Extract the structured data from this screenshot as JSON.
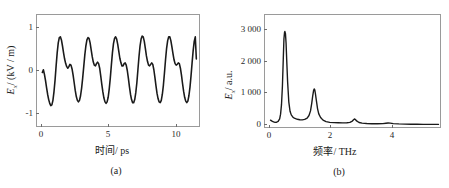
{
  "figure": {
    "background": "#ffffff",
    "line_color": "#1a1a1a",
    "frame_color": "#9a9a9a"
  },
  "panel_a": {
    "caption": "(a)",
    "xlabel_cjk": "时间",
    "xlabel_unit": "/ ps",
    "ylabel_sym": "E",
    "ylabel_sub": "x",
    "ylabel_unit": "/ (kV / m)",
    "xticks": [
      "0",
      "5",
      "10"
    ],
    "yticks": [
      "1",
      "0",
      "-1"
    ]
  },
  "panel_b": {
    "caption": "(b)",
    "xlabel_cjk": "频率",
    "xlabel_unit": "/ THz",
    "ylabel_sym": "E",
    "ylabel_sub": "x",
    "ylabel_unit": "/ a.u.",
    "xticks": [
      "0",
      "2",
      "4"
    ],
    "yticks": [
      "3 000",
      "2 000",
      "1 000",
      "0"
    ]
  },
  "chart_data": [
    {
      "type": "line",
      "id": "panel-a-waveform",
      "title": "(a)",
      "xlabel": "时间/ps",
      "ylabel": "Ex/(kV/m)",
      "xlim": [
        -0.4,
        11.8
      ],
      "ylim": [
        -1.45,
        1.45
      ],
      "xticks": [
        0,
        5,
        10
      ],
      "yticks": [
        -1,
        0,
        1
      ],
      "grid": false,
      "legend": null,
      "x": [
        0.0,
        0.08,
        0.16,
        0.24,
        0.32,
        0.4,
        0.48,
        0.56,
        0.64,
        0.72,
        0.8,
        0.88,
        0.96,
        1.04,
        1.12,
        1.2,
        1.28,
        1.36,
        1.44,
        1.52,
        1.6,
        1.68,
        1.76,
        1.84,
        1.92,
        2.0,
        2.08,
        2.16,
        2.24,
        2.32,
        2.4,
        2.48,
        2.56,
        2.64,
        2.72,
        2.8,
        2.88,
        2.96,
        3.04,
        3.12,
        3.2,
        3.28,
        3.36,
        3.44,
        3.52,
        3.6,
        3.68,
        3.76,
        3.84,
        3.92,
        4.0,
        4.08,
        4.16,
        4.24,
        4.32,
        4.4,
        4.48,
        4.56,
        4.64,
        4.72,
        4.8,
        4.88,
        4.96,
        5.04,
        5.12,
        5.2,
        5.28,
        5.36,
        5.44,
        5.52,
        5.6,
        5.68,
        5.76,
        5.84,
        5.92,
        6.0,
        6.08,
        6.16,
        6.24,
        6.32,
        6.4,
        6.48,
        6.56,
        6.64,
        6.72,
        6.8,
        6.88,
        6.96,
        7.04,
        7.12,
        7.2,
        7.28,
        7.36,
        7.44,
        7.52,
        7.6,
        7.68,
        7.76,
        7.84,
        7.92,
        8.0,
        8.08,
        8.16,
        8.24,
        8.32,
        8.4,
        8.48,
        8.56,
        8.64,
        8.72,
        8.8,
        8.88,
        8.96,
        9.04,
        9.12,
        9.2,
        9.28,
        9.36,
        9.44,
        9.52,
        9.6,
        9.68,
        9.76,
        9.84,
        9.92,
        10.0,
        10.08,
        10.16,
        10.24,
        10.32,
        10.4,
        10.48,
        10.56,
        10.64,
        10.72,
        10.8,
        10.88,
        10.96,
        11.04,
        11.12,
        11.2,
        11.28,
        11.36,
        11.44,
        11.52,
        11.6
      ],
      "y": [
        -0.05,
        0.02,
        -0.1,
        -0.26,
        -0.45,
        -0.62,
        -0.76,
        -0.86,
        -0.92,
        -0.9,
        -0.78,
        -0.55,
        -0.25,
        0.12,
        0.46,
        0.72,
        0.86,
        0.88,
        0.8,
        0.64,
        0.46,
        0.3,
        0.18,
        0.1,
        0.06,
        0.1,
        0.16,
        0.14,
        0.04,
        -0.12,
        -0.32,
        -0.52,
        -0.68,
        -0.78,
        -0.82,
        -0.78,
        -0.66,
        -0.46,
        -0.2,
        0.1,
        0.4,
        0.64,
        0.8,
        0.86,
        0.84,
        0.72,
        0.54,
        0.36,
        0.22,
        0.14,
        0.12,
        0.18,
        0.22,
        0.18,
        0.06,
        -0.14,
        -0.36,
        -0.56,
        -0.72,
        -0.82,
        -0.86,
        -0.82,
        -0.7,
        -0.48,
        -0.2,
        0.14,
        0.46,
        0.7,
        0.84,
        0.88,
        0.82,
        0.68,
        0.5,
        0.32,
        0.2,
        0.12,
        0.12,
        0.18,
        0.2,
        0.14,
        0.0,
        -0.2,
        -0.42,
        -0.62,
        -0.76,
        -0.84,
        -0.84,
        -0.76,
        -0.58,
        -0.32,
        0.02,
        0.36,
        0.64,
        0.82,
        0.9,
        0.88,
        0.76,
        0.58,
        0.38,
        0.24,
        0.14,
        0.12,
        0.16,
        0.2,
        0.16,
        0.02,
        -0.18,
        -0.4,
        -0.6,
        -0.74,
        -0.82,
        -0.84,
        -0.78,
        -0.62,
        -0.38,
        -0.06,
        0.28,
        0.58,
        0.78,
        0.88,
        0.88,
        0.78,
        0.62,
        0.44,
        0.28,
        0.18,
        0.14,
        0.16,
        0.2,
        0.18,
        0.06,
        -0.12,
        -0.34,
        -0.54,
        -0.7,
        -0.8,
        -0.84,
        -0.8,
        -0.66,
        -0.44,
        -0.14,
        0.2,
        0.52,
        0.76,
        0.88,
        0.3
      ]
    },
    {
      "type": "line",
      "id": "panel-b-spectrum",
      "title": "(b)",
      "xlabel": "频率/THz",
      "ylabel": "Ex/a.u.",
      "xlim": [
        -0.18,
        5.55
      ],
      "ylim": [
        -60,
        3350
      ],
      "xticks": [
        0,
        2,
        4
      ],
      "yticks": [
        0,
        1000,
        2000,
        3000
      ],
      "grid": false,
      "legend": null,
      "peaks": [
        {
          "freq": 0.47,
          "amp": 2850
        },
        {
          "freq": 1.43,
          "amp": 1100
        },
        {
          "freq": 2.75,
          "amp": 185
        },
        {
          "freq": 3.85,
          "amp": 62
        }
      ],
      "x": [
        0.0,
        0.05,
        0.1,
        0.15,
        0.2,
        0.25,
        0.3,
        0.33,
        0.36,
        0.39,
        0.42,
        0.44,
        0.46,
        0.47,
        0.49,
        0.51,
        0.53,
        0.56,
        0.6,
        0.64,
        0.68,
        0.74,
        0.8,
        0.88,
        0.96,
        1.04,
        1.12,
        1.2,
        1.26,
        1.31,
        1.35,
        1.38,
        1.41,
        1.43,
        1.45,
        1.47,
        1.5,
        1.54,
        1.58,
        1.64,
        1.72,
        1.82,
        1.94,
        2.08,
        2.22,
        2.36,
        2.5,
        2.6,
        2.68,
        2.72,
        2.75,
        2.78,
        2.82,
        2.9,
        3.0,
        3.15,
        3.32,
        3.5,
        3.68,
        3.78,
        3.85,
        3.92,
        4.02,
        4.2,
        4.4,
        4.6,
        4.8,
        5.0,
        5.2,
        5.4,
        5.5
      ],
      "y": [
        150,
        120,
        95,
        80,
        85,
        110,
        190,
        330,
        620,
        1180,
        2050,
        2620,
        2820,
        2850,
        2780,
        2500,
        2000,
        1320,
        700,
        420,
        310,
        235,
        200,
        175,
        160,
        158,
        170,
        210,
        290,
        430,
        660,
        870,
        1050,
        1100,
        1070,
        960,
        760,
        500,
        340,
        230,
        150,
        105,
        82,
        72,
        68,
        66,
        70,
        82,
        120,
        160,
        185,
        168,
        125,
        78,
        58,
        46,
        40,
        38,
        44,
        55,
        62,
        56,
        44,
        34,
        28,
        24,
        22,
        20,
        19,
        18,
        18
      ]
    }
  ]
}
